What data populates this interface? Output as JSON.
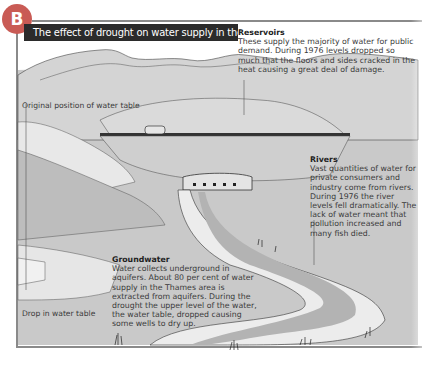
{
  "badge": {
    "letter": "B",
    "color": "#c95b55"
  },
  "title": "The effect of drought on water supply in the UK",
  "annotations": {
    "reservoirs": {
      "heading": "Reservoirs",
      "text": "These supply the majority of water for public demand. During 1976 levels dropped so much that the floors and sides cracked in the heat causing a great deal of damage."
    },
    "rivers": {
      "heading": "Rivers",
      "text": "Vast quantities of water for private consumers and industry come from rivers. During 1976 the river levels fell dramatically. The lack of water meant that pollution increased and many fish died."
    },
    "groundwater": {
      "heading": "Groundwater",
      "text": "Water collects underground in aquifers. About 80 per cent of water supply in the Thames area is extracted from aquifers. During the drought the upper level of the water, the water table, dropped causing some wells to dry up."
    }
  },
  "labels": {
    "original_water_table": "Original position of water table",
    "drop_in_water_table": "Drop in water table"
  },
  "colors": {
    "background": "#ffffff",
    "land": "#c8c8c8",
    "hills": "#d6d6d6",
    "river": "#b5b5b5",
    "riverbank": "#ececec",
    "title_bar": "#2b2b2b"
  }
}
